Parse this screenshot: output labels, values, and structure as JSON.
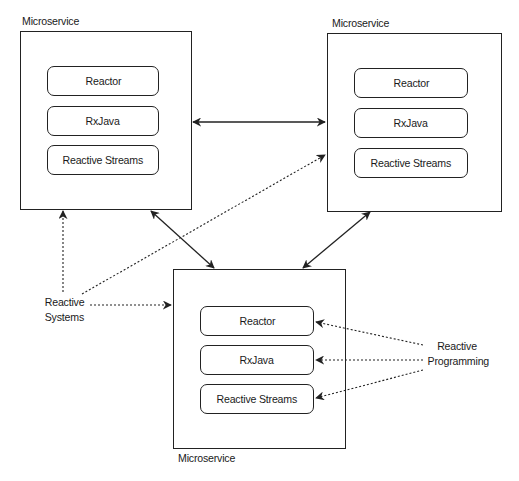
{
  "diagram": {
    "microservices": [
      {
        "id": "top-left",
        "label": "Microservice",
        "components": [
          "Reactor",
          "RxJava",
          "Reactive Streams"
        ]
      },
      {
        "id": "top-right",
        "label": "Microservice",
        "components": [
          "Reactor",
          "RxJava",
          "Reactive Streams"
        ]
      },
      {
        "id": "bottom",
        "label": "Microservice",
        "components": [
          "Reactor",
          "RxJava",
          "Reactive Streams"
        ]
      }
    ],
    "annotations": {
      "reactive_systems": {
        "line1": "Reactive",
        "line2": "Systems"
      },
      "reactive_programming": {
        "line1": "Reactive",
        "line2": "Programming"
      }
    },
    "connections": [
      {
        "from": "top-left",
        "to": "top-right",
        "style": "solid",
        "direction": "bidirectional"
      },
      {
        "from": "top-left",
        "to": "bottom",
        "style": "solid",
        "direction": "bidirectional"
      },
      {
        "from": "top-right",
        "to": "bottom",
        "style": "solid",
        "direction": "bidirectional"
      },
      {
        "from": "reactive_systems",
        "to": "top-left",
        "style": "dotted"
      },
      {
        "from": "reactive_systems",
        "to": "top-right",
        "style": "dotted"
      },
      {
        "from": "reactive_systems",
        "to": "bottom",
        "style": "dotted"
      },
      {
        "from": "reactive_programming",
        "to": "bottom.Reactor",
        "style": "dotted"
      },
      {
        "from": "reactive_programming",
        "to": "bottom.RxJava",
        "style": "dotted"
      },
      {
        "from": "reactive_programming",
        "to": "bottom.Reactive Streams",
        "style": "dotted"
      }
    ],
    "colors": {
      "stroke": "#222222",
      "background": "#ffffff",
      "text": "#1a1a1a"
    }
  }
}
